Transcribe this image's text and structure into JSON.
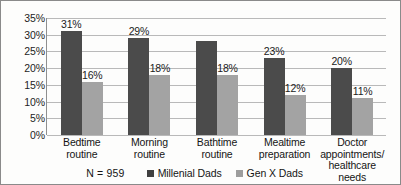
{
  "chart_data": {
    "type": "bar",
    "title": "",
    "subtitle": "",
    "xlabel": "",
    "ylabel": "",
    "ylim": [
      0,
      35
    ],
    "ytick_labels": [
      "35%",
      "30%",
      "25%",
      "20%",
      "15%",
      "10%",
      "5%",
      "0%"
    ],
    "ytick_values": [
      35,
      30,
      25,
      20,
      15,
      10,
      5,
      0
    ],
    "grid": true,
    "legend_position": "bottom",
    "categories": [
      "Bedtime routine",
      "Morning routine",
      "Bathtime routine",
      "Mealtime preparation",
      "Doctor appointments/ healthcare needs"
    ],
    "category_lines": [
      [
        "Bedtime",
        "routine"
      ],
      [
        "Morning",
        "routine"
      ],
      [
        "Bathtime",
        "routine"
      ],
      [
        "Mealtime",
        "preparation"
      ],
      [
        "Doctor",
        "appointments/",
        "healthcare needs"
      ]
    ],
    "series": [
      {
        "name": "Millenial Dads",
        "color": "#4b4b4b",
        "values": [
          31,
          29,
          28,
          23,
          20
        ],
        "labels": [
          "31%",
          "29%",
          "",
          "23%",
          "20%"
        ]
      },
      {
        "name": "Gen X Dads",
        "color": "#a3a3a3",
        "values": [
          16,
          18,
          18,
          12,
          11
        ],
        "labels": [
          "16%",
          "18%",
          "18%",
          "12%",
          "11%"
        ]
      }
    ],
    "annotations": {
      "sample_size": "N = 959"
    }
  },
  "legend": {
    "items": [
      {
        "label": "Millenial Dads"
      },
      {
        "label": "Gen X Dads"
      }
    ]
  }
}
